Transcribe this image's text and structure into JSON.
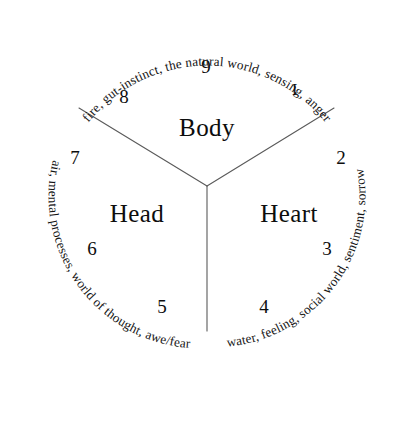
{
  "figure": {
    "name": "Three Centers of Intelligence Diagram",
    "shape": "circle-divided-in-thirds"
  },
  "centers": [
    {
      "id": "body",
      "label": "Body",
      "arc_label": "fire, gut-instinct, the natural world, sensing, anger",
      "points": [
        "8",
        "9",
        "1"
      ]
    },
    {
      "id": "heart",
      "label": "Heart",
      "arc_label": "water, feeling, social world, sentiment, sorrow",
      "points": [
        "2",
        "3",
        "4"
      ]
    },
    {
      "id": "head",
      "label": "Head",
      "arc_label": "air, mental processes, world of thought, awe/fear",
      "points": [
        "5",
        "6",
        "7"
      ]
    }
  ],
  "numbers": {
    "n1": "I",
    "n2": "2",
    "n3": "3",
    "n4": "4",
    "n5": "5",
    "n6": "6",
    "n7": "7",
    "n8": "8",
    "n9": "9"
  },
  "labels": {
    "body": "Body",
    "heart": "Heart",
    "head": "Head"
  },
  "arcs": {
    "body": "fire, gut-instinct, the natural world, sensing, anger",
    "heart": "water, feeling, social world, sentiment, sorrow",
    "head": "air, mental processes, world of thought, awe/fear"
  },
  "colors": {
    "background": "#ffffff",
    "text": "#0d0d0d",
    "line": "#5a5a5a"
  }
}
